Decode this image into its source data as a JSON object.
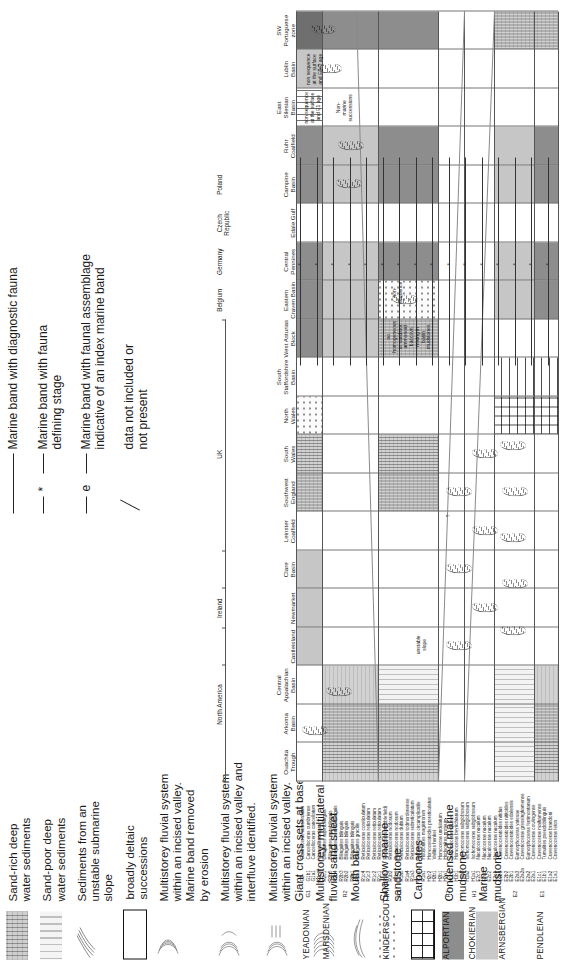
{
  "figure": {
    "kind": "stratigraphic-correlation-chart",
    "orientation": "rotated-90-ccw"
  },
  "legend_lithology": [
    {
      "swatch": "sand-rich-deepwater",
      "label": "Sand-rich deep\nwater sediments"
    },
    {
      "swatch": "sand-poor-deepwater",
      "label": "Sand-poor deep\nwater sediments"
    },
    {
      "swatch": "unstable-slope",
      "label": "Sediments from an\nunstable submarine\nslope"
    },
    {
      "swatch": "deltaic",
      "label": "broadly deltaic\nsuccessions"
    },
    {
      "swatch": "incised-valley-1",
      "label": "Multistorey fluvial system\nwithin an incised valley.\nMarine band removed\nby erosion"
    },
    {
      "swatch": "incised-valley-2",
      "label": "Multistorey fluvial system\nwithin an incised valley and\ninterfluve identified."
    },
    {
      "swatch": "incised-valley-3",
      "label": "Multistorey fluvial system\nwithin an incised valley.\nGiant cross sets at base"
    },
    {
      "swatch": "multilateral-sheet",
      "label": "Multistorey, multilateral\nfluvial sand sheet"
    },
    {
      "swatch": "mouth-bar",
      "label": "Mouth bar"
    },
    {
      "swatch": "shallow-marine-sandstone",
      "label": "Shallow marine\nsandstone"
    },
    {
      "swatch": "carbonates",
      "label": "Carbonates"
    },
    {
      "swatch": "condensed-marine-mudstone",
      "label": "Condensed marine\nmudstone"
    },
    {
      "swatch": "marine-mudstone",
      "label": "Marine\nmudstone"
    }
  ],
  "legend_symbols": [
    {
      "key": "solid-line",
      "label": "Marine band with diagnostic fauna"
    },
    {
      "key": "dashed-star",
      "mark": "*",
      "label": "Marine band with  fauna\ndefining stage"
    },
    {
      "key": "dashed-e",
      "mark": "e",
      "label": "Marine band with  faunal assemblage\nindicative of an index marine band"
    },
    {
      "key": "slash",
      "label": "data not included or\nnot present"
    }
  ],
  "columns": {
    "groups": [
      {
        "name": "North America",
        "span": [
          0,
          3
        ]
      },
      {
        "name": "Ireland",
        "span": [
          3,
          5
        ]
      },
      {
        "name": "UK",
        "span": [
          5,
          11
        ]
      }
    ],
    "countries": [
      {
        "name": "Belgium",
        "col": 12
      },
      {
        "name": "Germany",
        "col": 13
      },
      {
        "name": "Czech\nRepublic",
        "col": 14
      },
      {
        "name": "Poland",
        "col": 15
      }
    ],
    "headers": [
      "Ouachita\nTrough",
      "Arkoma\nBasin",
      "Central\nAppalachian\nBasin",
      "Castleisland",
      "Newmarket",
      "Clare\nBasin",
      "Leinster\nCoalfield",
      "Southwest England",
      "South\nWales",
      "North\nWales",
      "South\nStaffordshire\nBasin",
      "West Asturias\nBlock",
      "Eastern\nCraven Basin",
      "Central\nPennines",
      "Edale Gulf",
      "Campine\nBasin",
      "Ruhr\nCoalfield",
      "East\nSilesian\nBasin",
      "Lublin\nBasin",
      "SW\nPortuguese\nzone"
    ]
  },
  "stages": [
    {
      "name": "YEADONIAN",
      "code": "G1"
    },
    {
      "name": "MARSDENIAN",
      "code": "R2"
    },
    {
      "name": "KINDERSCOUTIAN",
      "code": "R1"
    },
    {
      "name": "ALPORTIAN",
      "code": "H2"
    },
    {
      "name": "CHOKIERIAN",
      "code": "H1"
    },
    {
      "name": "ARNSBERGIAN",
      "code": "E2"
    },
    {
      "name": "PENDLEIAN",
      "code": "E1"
    }
  ],
  "marine_bands": [
    {
      "code": "G2",
      "name": "Gastrioceras subcrenatum",
      "stage": "YEADONIAN"
    },
    {
      "code": "G1b1",
      "name": "Cancelloceras cumbriense",
      "stage": "YEADONIAN"
    },
    {
      "code": "G1a1",
      "name": "Cancelloceras cancellatum",
      "stage": "YEADONIAN"
    },
    {
      "code": "R2c2",
      "name": "Verneuilites nigra",
      "stage": "MARSDENIAN"
    },
    {
      "code": "R2c1",
      "name": "Bilinguites superbilinguis",
      "stage": "MARSDENIAN"
    },
    {
      "code": "R2b5",
      "name": "Bilinguites metabilinguis",
      "stage": "MARSDENIAN"
    },
    {
      "code": "R2b4",
      "name": "Bilinguites eometabilinguis",
      "stage": "MARSDENIAN"
    },
    {
      "code": "R2b3",
      "name": "Bilinguites bilinguis",
      "stage": "MARSDENIAN"
    },
    {
      "code": "R2b2",
      "name": "Bilinguites bilinguis",
      "stage": "MARSDENIAN"
    },
    {
      "code": "R2b1",
      "name": "Bilinguites bilinguis",
      "stage": "MARSDENIAN"
    },
    {
      "code": "R2a1",
      "name": "Bilinguites gracilis",
      "stage": "MARSDENIAN"
    },
    {
      "code": "R1c4",
      "name": "Reticuloceras coreticulatum",
      "stage": "KINDERSCOUTIAN"
    },
    {
      "code": "R1c3",
      "name": "Reticuloceras reticulatum",
      "stage": "KINDERSCOUTIAN"
    },
    {
      "code": "R1c2",
      "name": "Reticuloceras reticulatum",
      "stage": "KINDERSCOUTIAN"
    },
    {
      "code": "R1c1",
      "name": "Reticuloceras reticulatum",
      "stage": "KINDERSCOUTIAN"
    },
    {
      "code": "R1b3",
      "name": "Reticuloceras stubblefieldi",
      "stage": "KINDERSCOUTIAN"
    },
    {
      "code": "R1b2",
      "name": "Reticuloceras nodosum",
      "stage": "KINDERSCOUTIAN"
    },
    {
      "code": "R1b1",
      "name": "Reticuloceras nodosum",
      "stage": "KINDERSCOUTIAN"
    },
    {
      "code": "R1a5",
      "name": "Reticuloceras dubium",
      "stage": "KINDERSCOUTIAN"
    },
    {
      "code": "R1a4",
      "name": "Reticuloceras todmordenense",
      "stage": "KINDERSCOUTIAN"
    },
    {
      "code": "R1a3",
      "name": "Reticuloceras subreticulatum",
      "stage": "KINDERSCOUTIAN"
    },
    {
      "code": "R1a2",
      "name": "Reticuloceras circumplicatile",
      "stage": "KINDERSCOUTIAN"
    },
    {
      "code": "R1a1",
      "name": "Hodsonites magistrorum",
      "stage": "KINDERSCOUTIAN"
    },
    {
      "code": "H2c2",
      "name": "Homoceratoides prereticulatus",
      "stage": "ALPORTIAN"
    },
    {
      "code": "H2b1",
      "name": "Vallites henkei",
      "stage": "ALPORTIAN"
    },
    {
      "code": "H2b1",
      "name": "Homoceras undulatum",
      "stage": "ALPORTIAN"
    },
    {
      "code": "H2a1",
      "name": "Hodsonites proteum",
      "stage": "ALPORTIAN"
    },
    {
      "code": "H1b2",
      "name": "Isohomoceras sp. nov.",
      "stage": "CHOKIERIAN"
    },
    {
      "code": "H1b1",
      "name": "Homoceras beyrichianum",
      "stage": "CHOKIERIAN"
    },
    {
      "code": "H1a3",
      "name": "Isohomoceras subglobosum",
      "stage": "CHOKIERIAN"
    },
    {
      "code": "H1a2",
      "name": "Isohomoceras subglobosum",
      "stage": "CHOKIERIAN"
    },
    {
      "code": "H1a1",
      "name": "Isohomoceras subglobosum",
      "stage": "CHOKIERIAN"
    },
    {
      "code": "E2c3",
      "name": "Nuculoceras nuculum",
      "stage": "ARNSBERGIAN"
    },
    {
      "code": "E2c3",
      "name": "Nuculoceras nuculum",
      "stage": "ARNSBERGIAN"
    },
    {
      "code": "E2c2",
      "name": "Nuculoceras nuculum",
      "stage": "ARNSBERGIAN"
    },
    {
      "code": "E2c1",
      "name": "Nuculoceras nuculum",
      "stage": "ARNSBERGIAN"
    },
    {
      "code": "E2b3",
      "name": "Cravenoceratoides nitidus",
      "stage": "ARNSBERGIAN"
    },
    {
      "code": "E2b2",
      "name": "Cravenoceratoides nititoides",
      "stage": "ARNSBERGIAN"
    },
    {
      "code": "E2b1",
      "name": "Cravenoceratoides edalensis",
      "stage": "ARNSBERGIAN"
    },
    {
      "code": "E2a3",
      "name": "Eumorphoceras yatesae",
      "stage": "ARNSBERGIAN"
    },
    {
      "code": "E2a2a",
      "name": "Cravenoceras gressinghamense",
      "stage": "ARNSBERGIAN"
    },
    {
      "code": "E2a2",
      "name": "Eumorphoceras ferrimontanum",
      "stage": "ARNSBERGIAN"
    },
    {
      "code": "E2a1",
      "name": "Cravenoceras cowlingense",
      "stage": "ARNSBERGIAN"
    },
    {
      "code": "E1c1",
      "name": "Cravenoceras malhamense",
      "stage": "PENDLEIAN"
    },
    {
      "code": "E1b1",
      "name": "Tumulites pseudobilinguis",
      "stage": "PENDLEIAN"
    },
    {
      "code": "E1a2",
      "name": "Cravenoceras brandoni",
      "stage": "PENDLEIAN"
    },
    {
      "code": "E1a1",
      "name": "Cravenoceras leion",
      "stage": "PENDLEIAN"
    }
  ],
  "annotations": [
    {
      "text": "non-\nsequence",
      "col": "Eastern Craven Basin"
    },
    {
      "text": "unstable\nslope",
      "col": "Castleisland"
    },
    {
      "text": "no\nhomogeneous\nor sandstor\nammonoid\nbaccovn\nmixing in\nbasin\nmudstones",
      "col": "West Asturias Block"
    },
    {
      "text": "Non-\nmarine\nsuccessions",
      "col": "East Silesian Basin"
    },
    {
      "text": "non sequence\nat the surface\nand E2c2 age",
      "col": "Lublin Basin"
    },
    {
      "text": "non sequence\nat the surface\nand E1 age",
      "col": "East Silesian Basin"
    },
    {
      "text": "?",
      "col": "Leinster Coalfield"
    }
  ],
  "chart_data": {
    "type": "table",
    "xlabel": "Basins / regions",
    "ylabel": "Marine bands (chronostratigraphy)",
    "grid": true,
    "legend_position": "top"
  }
}
